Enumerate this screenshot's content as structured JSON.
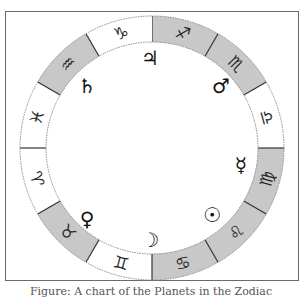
{
  "figure": {
    "caption": "Figure: A chart of the Planets in the Zodiac",
    "colors": {
      "frame_border": "#6a6a6a",
      "shaded_segment": "#c8c8c8",
      "plain_segment": "#ffffff",
      "divider": "#333333",
      "ring_edge": "#8a8a8a",
      "glyph": "#111111"
    },
    "wheel": {
      "center_x": 152,
      "center_y": 148,
      "outer_radius": 132,
      "inner_radius": 106,
      "segment_degrees": 30
    },
    "signs": [
      {
        "name": "Sagittarius",
        "glyph": "♐",
        "shaded": true,
        "start_angle": 0
      },
      {
        "name": "Scorpio",
        "glyph": "♏",
        "shaded": true,
        "start_angle": 30
      },
      {
        "name": "Libra",
        "glyph": "♎",
        "shaded": false,
        "start_angle": 60
      },
      {
        "name": "Virgo",
        "glyph": "♍",
        "shaded": true,
        "start_angle": 90
      },
      {
        "name": "Leo",
        "glyph": "♌",
        "shaded": true,
        "start_angle": 120
      },
      {
        "name": "Cancer",
        "glyph": "♋",
        "shaded": true,
        "start_angle": 150
      },
      {
        "name": "Gemini",
        "glyph": "♊",
        "shaded": false,
        "start_angle": 180
      },
      {
        "name": "Taurus",
        "glyph": "♉",
        "shaded": true,
        "start_angle": 210
      },
      {
        "name": "Aries",
        "glyph": "♈",
        "shaded": false,
        "start_angle": 240
      },
      {
        "name": "Pisces",
        "glyph": "♓",
        "shaded": false,
        "start_angle": 270
      },
      {
        "name": "Aquarius",
        "glyph": "♒",
        "shaded": true,
        "start_angle": 300
      },
      {
        "name": "Capricorn",
        "glyph": "♑",
        "shaded": false,
        "start_angle": 330
      }
    ],
    "planets": [
      {
        "name": "Jupiter",
        "glyph": "♃",
        "x": 150,
        "y": 58
      },
      {
        "name": "Mars",
        "glyph": "♂",
        "x": 221,
        "y": 86
      },
      {
        "name": "Saturn",
        "glyph": "♄",
        "x": 87,
        "y": 86
      },
      {
        "name": "Mercury",
        "glyph": "☿",
        "x": 241,
        "y": 165
      },
      {
        "name": "Venus",
        "glyph": "♀",
        "x": 87,
        "y": 219
      },
      {
        "name": "Sun",
        "glyph": "☉",
        "x": 212,
        "y": 215
      },
      {
        "name": "Moon",
        "glyph": "☽",
        "x": 150,
        "y": 240
      }
    ]
  }
}
